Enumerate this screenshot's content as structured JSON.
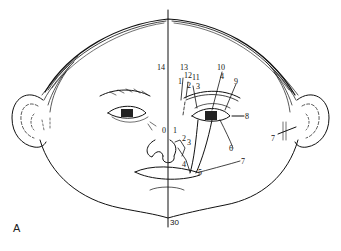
{
  "figure": {
    "panel_label": "A",
    "midline_label_top": "14",
    "midline_label_bottom": "30",
    "labels": {
      "l0": "0",
      "l1": "1",
      "l2": "2",
      "l3": "3",
      "l4": "4",
      "l5": "5",
      "l6": "6",
      "l7": "7",
      "l7_ear": "7",
      "l8": "8",
      "l9": "9",
      "l10": "10",
      "l11": "11",
      "l12": "12",
      "l13": "13",
      "l14": "14",
      "l30": "30",
      "l_upper_4": "4",
      "l_upper_3": "3",
      "l_upper_2": "2",
      "l_upper_1": "1"
    },
    "colors": {
      "ink": "#111111",
      "background": "#ffffff"
    }
  }
}
